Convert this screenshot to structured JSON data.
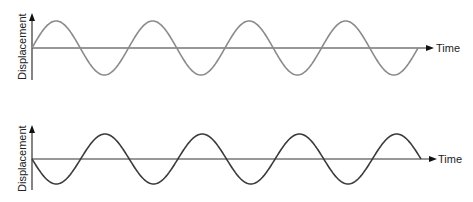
{
  "diagram": {
    "type": "wave-comparison",
    "panels": [
      {
        "id": "top",
        "y_label": "Displacement",
        "x_label": "Time",
        "wave_color": "#8a8a8a",
        "axis_color": "#333333",
        "phase": "sine (starts at zero, rises first)",
        "cycles": 4
      },
      {
        "id": "bottom",
        "y_label": "Displacement",
        "x_label": "Time",
        "wave_color": "#3a3a3a",
        "axis_color": "#333333",
        "phase": "inverted sine (starts at zero, falls first)",
        "cycles": 4
      }
    ]
  }
}
